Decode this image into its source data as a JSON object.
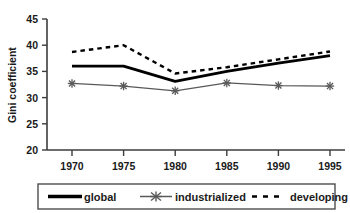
{
  "chart_data": {
    "type": "line",
    "title": "",
    "xlabel": "",
    "ylabel": "Gini coefficient",
    "categories": [
      "1970",
      "1975",
      "1980",
      "1985",
      "1990",
      "1995"
    ],
    "x": [
      1970,
      1975,
      1980,
      1985,
      1990,
      1995
    ],
    "xlim": [
      1967.5,
      1997.5
    ],
    "ylim": [
      20,
      45
    ],
    "yticks": [
      20,
      25,
      30,
      35,
      40,
      45
    ],
    "ytick_labels": [
      "20",
      "25",
      "30",
      "35",
      "40",
      "45"
    ],
    "grid": false,
    "legend_position": "bottom",
    "series": [
      {
        "name": "global",
        "style": "solid-thick",
        "marker": "none",
        "color": "#000000",
        "values": [
          36.0,
          36.0,
          33.1,
          35.0,
          36.6,
          38.0
        ]
      },
      {
        "name": "industrialized",
        "style": "solid-thin",
        "marker": "star",
        "color": "#595959",
        "values": [
          32.7,
          32.2,
          31.3,
          32.8,
          32.3,
          32.2
        ]
      },
      {
        "name": "developing",
        "style": "dashed",
        "marker": "none",
        "color": "#000000",
        "values": [
          38.7,
          40.0,
          34.6,
          35.8,
          37.3,
          38.8
        ]
      }
    ]
  },
  "axes": {
    "ylabel": "Gini coefficient"
  },
  "legend": {
    "items": [
      {
        "label": "global",
        "key": "global"
      },
      {
        "label": "industrialized",
        "key": "industrialized"
      },
      {
        "label": "developing",
        "key": "developing"
      }
    ]
  },
  "colors": {
    "axis": "#3d3d3d",
    "text": "#1a1a1a",
    "global": "#000000",
    "industrialized": "#595959",
    "developing": "#000000",
    "legend_border": "#4d4d4d"
  }
}
